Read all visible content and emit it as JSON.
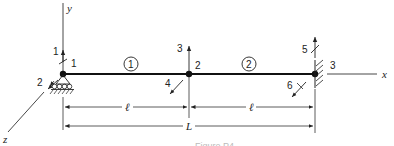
{
  "diagram": {
    "type": "beam finite element model",
    "axes": {
      "x_label": "x",
      "y_label": "y",
      "z_label": "z"
    },
    "nodes": [
      {
        "id": "1",
        "label": "1",
        "support": "pin-roller"
      },
      {
        "id": "2",
        "label": "2",
        "support": "none"
      },
      {
        "id": "3",
        "label": "3",
        "support": "fixed"
      }
    ],
    "elements": [
      {
        "id": "1",
        "label": "1",
        "from": "1",
        "to": "2"
      },
      {
        "id": "2",
        "label": "2",
        "from": "2",
        "to": "3"
      }
    ],
    "dofs": [
      {
        "label": "1",
        "node": "1",
        "type": "translation-y"
      },
      {
        "label": "2",
        "node": "1",
        "type": "rotation-z"
      },
      {
        "label": "3",
        "node": "2",
        "type": "translation-y"
      },
      {
        "label": "4",
        "node": "2",
        "type": "rotation-z"
      },
      {
        "label": "5",
        "node": "3",
        "type": "translation-y"
      },
      {
        "label": "6",
        "node": "3",
        "type": "rotation-z"
      }
    ],
    "dimensions": {
      "element_length": "ℓ",
      "total_length": "L"
    },
    "caption": "Figure P4-..."
  }
}
